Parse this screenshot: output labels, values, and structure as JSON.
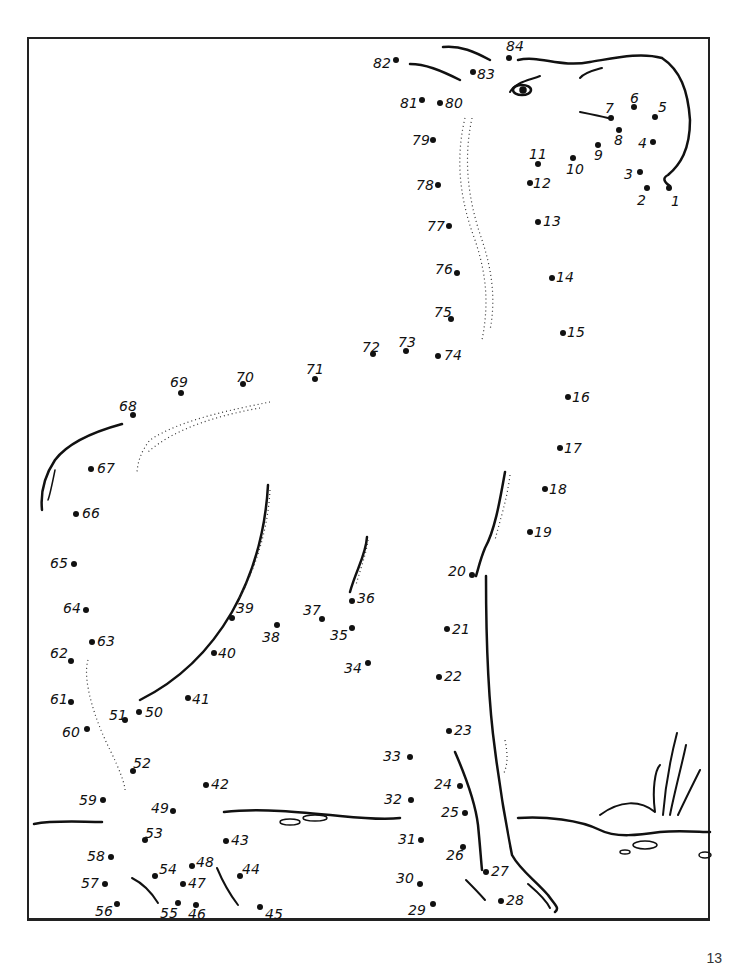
{
  "page": {
    "type": "connect-the-dots worksheet",
    "page_number": "13",
    "total_dots": 84
  },
  "dots": [
    {
      "n": "1",
      "x": 669,
      "y": 188,
      "lx": 671,
      "ly": 194
    },
    {
      "n": "2",
      "x": 647,
      "y": 188,
      "lx": 637,
      "ly": 193
    },
    {
      "n": "3",
      "x": 640,
      "y": 172,
      "lx": 624,
      "ly": 167
    },
    {
      "n": "4",
      "x": 653,
      "y": 142,
      "lx": 638,
      "ly": 136
    },
    {
      "n": "5",
      "x": 655,
      "y": 117,
      "lx": 658,
      "ly": 100
    },
    {
      "n": "6",
      "x": 634,
      "y": 107,
      "lx": 630,
      "ly": 91
    },
    {
      "n": "7",
      "x": 611,
      "y": 118,
      "lx": 605,
      "ly": 101
    },
    {
      "n": "8",
      "x": 619,
      "y": 130,
      "lx": 614,
      "ly": 133
    },
    {
      "n": "9",
      "x": 598,
      "y": 145,
      "lx": 594,
      "ly": 148
    },
    {
      "n": "10",
      "x": 573,
      "y": 158,
      "lx": 566,
      "ly": 162
    },
    {
      "n": "11",
      "x": 538,
      "y": 164,
      "lx": 529,
      "ly": 147
    },
    {
      "n": "12",
      "x": 530,
      "y": 183,
      "lx": 533,
      "ly": 176
    },
    {
      "n": "13",
      "x": 538,
      "y": 222,
      "lx": 543,
      "ly": 214
    },
    {
      "n": "14",
      "x": 552,
      "y": 278,
      "lx": 556,
      "ly": 270
    },
    {
      "n": "15",
      "x": 563,
      "y": 333,
      "lx": 567,
      "ly": 325
    },
    {
      "n": "16",
      "x": 568,
      "y": 397,
      "lx": 572,
      "ly": 390
    },
    {
      "n": "17",
      "x": 560,
      "y": 448,
      "lx": 564,
      "ly": 441
    },
    {
      "n": "18",
      "x": 545,
      "y": 489,
      "lx": 549,
      "ly": 482
    },
    {
      "n": "19",
      "x": 530,
      "y": 532,
      "lx": 534,
      "ly": 525
    },
    {
      "n": "20",
      "x": 472,
      "y": 575,
      "lx": 448,
      "ly": 564
    },
    {
      "n": "21",
      "x": 447,
      "y": 629,
      "lx": 452,
      "ly": 622
    },
    {
      "n": "22",
      "x": 439,
      "y": 677,
      "lx": 444,
      "ly": 669
    },
    {
      "n": "23",
      "x": 449,
      "y": 731,
      "lx": 454,
      "ly": 723
    },
    {
      "n": "24",
      "x": 460,
      "y": 786,
      "lx": 434,
      "ly": 777
    },
    {
      "n": "25",
      "x": 465,
      "y": 813,
      "lx": 441,
      "ly": 805
    },
    {
      "n": "26",
      "x": 463,
      "y": 847,
      "lx": 446,
      "ly": 848
    },
    {
      "n": "27",
      "x": 486,
      "y": 872,
      "lx": 491,
      "ly": 864
    },
    {
      "n": "28",
      "x": 501,
      "y": 901,
      "lx": 506,
      "ly": 893
    },
    {
      "n": "29",
      "x": 433,
      "y": 904,
      "lx": 408,
      "ly": 903
    },
    {
      "n": "30",
      "x": 420,
      "y": 884,
      "lx": 396,
      "ly": 871
    },
    {
      "n": "31",
      "x": 421,
      "y": 840,
      "lx": 398,
      "ly": 832
    },
    {
      "n": "32",
      "x": 411,
      "y": 800,
      "lx": 384,
      "ly": 792
    },
    {
      "n": "33",
      "x": 410,
      "y": 757,
      "lx": 383,
      "ly": 749
    },
    {
      "n": "34",
      "x": 368,
      "y": 663,
      "lx": 344,
      "ly": 661
    },
    {
      "n": "35",
      "x": 352,
      "y": 628,
      "lx": 330,
      "ly": 628
    },
    {
      "n": "36",
      "x": 352,
      "y": 601,
      "lx": 357,
      "ly": 591
    },
    {
      "n": "37",
      "x": 322,
      "y": 619,
      "lx": 303,
      "ly": 603
    },
    {
      "n": "38",
      "x": 277,
      "y": 625,
      "lx": 262,
      "ly": 630
    },
    {
      "n": "39",
      "x": 232,
      "y": 618,
      "lx": 236,
      "ly": 601
    },
    {
      "n": "40",
      "x": 214,
      "y": 653,
      "lx": 218,
      "ly": 646
    },
    {
      "n": "41",
      "x": 188,
      "y": 698,
      "lx": 192,
      "ly": 692
    },
    {
      "n": "42",
      "x": 206,
      "y": 785,
      "lx": 211,
      "ly": 777
    },
    {
      "n": "43",
      "x": 226,
      "y": 841,
      "lx": 231,
      "ly": 833
    },
    {
      "n": "44",
      "x": 240,
      "y": 876,
      "lx": 242,
      "ly": 862
    },
    {
      "n": "45",
      "x": 260,
      "y": 907,
      "lx": 265,
      "ly": 907
    },
    {
      "n": "46",
      "x": 196,
      "y": 905,
      "lx": 188,
      "ly": 907
    },
    {
      "n": "47",
      "x": 183,
      "y": 884,
      "lx": 188,
      "ly": 876
    },
    {
      "n": "48",
      "x": 192,
      "y": 866,
      "lx": 196,
      "ly": 855
    },
    {
      "n": "49",
      "x": 173,
      "y": 811,
      "lx": 151,
      "ly": 801
    },
    {
      "n": "50",
      "x": 139,
      "y": 712,
      "lx": 145,
      "ly": 705
    },
    {
      "n": "51",
      "x": 125,
      "y": 720,
      "lx": 109,
      "ly": 708
    },
    {
      "n": "52",
      "x": 133,
      "y": 771,
      "lx": 133,
      "ly": 756
    },
    {
      "n": "53",
      "x": 145,
      "y": 840,
      "lx": 145,
      "ly": 826
    },
    {
      "n": "54",
      "x": 155,
      "y": 876,
      "lx": 159,
      "ly": 862
    },
    {
      "n": "55",
      "x": 178,
      "y": 903,
      "lx": 160,
      "ly": 906
    },
    {
      "n": "56",
      "x": 117,
      "y": 904,
      "lx": 95,
      "ly": 904
    },
    {
      "n": "57",
      "x": 105,
      "y": 884,
      "lx": 81,
      "ly": 876
    },
    {
      "n": "58",
      "x": 111,
      "y": 857,
      "lx": 87,
      "ly": 849
    },
    {
      "n": "59",
      "x": 103,
      "y": 800,
      "lx": 79,
      "ly": 793
    },
    {
      "n": "60",
      "x": 87,
      "y": 729,
      "lx": 62,
      "ly": 725
    },
    {
      "n": "61",
      "x": 71,
      "y": 702,
      "lx": 50,
      "ly": 692
    },
    {
      "n": "62",
      "x": 71,
      "y": 661,
      "lx": 50,
      "ly": 646
    },
    {
      "n": "63",
      "x": 92,
      "y": 642,
      "lx": 97,
      "ly": 634
    },
    {
      "n": "64",
      "x": 86,
      "y": 610,
      "lx": 63,
      "ly": 601
    },
    {
      "n": "65",
      "x": 74,
      "y": 564,
      "lx": 50,
      "ly": 556
    },
    {
      "n": "66",
      "x": 76,
      "y": 514,
      "lx": 82,
      "ly": 506
    },
    {
      "n": "67",
      "x": 91,
      "y": 469,
      "lx": 97,
      "ly": 461
    },
    {
      "n": "68",
      "x": 133,
      "y": 415,
      "lx": 119,
      "ly": 399
    },
    {
      "n": "69",
      "x": 181,
      "y": 393,
      "lx": 170,
      "ly": 375
    },
    {
      "n": "70",
      "x": 243,
      "y": 384,
      "lx": 236,
      "ly": 370
    },
    {
      "n": "71",
      "x": 315,
      "y": 379,
      "lx": 306,
      "ly": 362
    },
    {
      "n": "72",
      "x": 373,
      "y": 354,
      "lx": 362,
      "ly": 340
    },
    {
      "n": "73",
      "x": 406,
      "y": 351,
      "lx": 398,
      "ly": 335
    },
    {
      "n": "74",
      "x": 438,
      "y": 356,
      "lx": 444,
      "ly": 348
    },
    {
      "n": "75",
      "x": 451,
      "y": 319,
      "lx": 434,
      "ly": 305
    },
    {
      "n": "76",
      "x": 457,
      "y": 273,
      "lx": 435,
      "ly": 262
    },
    {
      "n": "77",
      "x": 449,
      "y": 226,
      "lx": 427,
      "ly": 219
    },
    {
      "n": "78",
      "x": 438,
      "y": 185,
      "lx": 416,
      "ly": 178
    },
    {
      "n": "79",
      "x": 433,
      "y": 140,
      "lx": 412,
      "ly": 133
    },
    {
      "n": "80",
      "x": 440,
      "y": 103,
      "lx": 445,
      "ly": 96
    },
    {
      "n": "81",
      "x": 422,
      "y": 100,
      "lx": 400,
      "ly": 96
    },
    {
      "n": "82",
      "x": 396,
      "y": 60,
      "lx": 373,
      "ly": 56
    },
    {
      "n": "83",
      "x": 473,
      "y": 72,
      "lx": 477,
      "ly": 67
    },
    {
      "n": "84",
      "x": 509,
      "y": 58,
      "lx": 506,
      "ly": 39
    }
  ]
}
